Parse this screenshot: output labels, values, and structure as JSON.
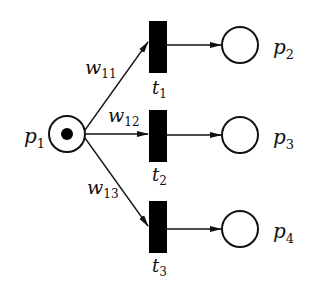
{
  "diagram": {
    "type": "petri-net",
    "colors": {
      "stroke": "#111111",
      "fill_transition": "#000000",
      "background": "#ffffff"
    },
    "places": [
      {
        "id": "p1",
        "name": "p",
        "sub": "1",
        "tokens": 1
      },
      {
        "id": "p2",
        "name": "p",
        "sub": "2",
        "tokens": 0
      },
      {
        "id": "p3",
        "name": "p",
        "sub": "3",
        "tokens": 0
      },
      {
        "id": "p4",
        "name": "p",
        "sub": "4",
        "tokens": 0
      }
    ],
    "transitions": [
      {
        "id": "t1",
        "name": "t",
        "sub": "1"
      },
      {
        "id": "t2",
        "name": "t",
        "sub": "2"
      },
      {
        "id": "t3",
        "name": "t",
        "sub": "3"
      }
    ],
    "arcs": [
      {
        "from": "p1",
        "to": "t1",
        "weight": {
          "name": "w",
          "sub": "11"
        }
      },
      {
        "from": "p1",
        "to": "t2",
        "weight": {
          "name": "w",
          "sub": "12"
        }
      },
      {
        "from": "p1",
        "to": "t3",
        "weight": {
          "name": "w",
          "sub": "13"
        }
      },
      {
        "from": "t1",
        "to": "p2"
      },
      {
        "from": "t2",
        "to": "p3"
      },
      {
        "from": "t3",
        "to": "p4"
      }
    ]
  }
}
